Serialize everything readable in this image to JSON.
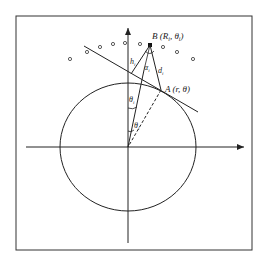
{
  "diagram": {
    "type": "geometry",
    "colors": {
      "stroke": "#222222",
      "background": "#ffffff"
    },
    "labels": {
      "B": "B (R",
      "B_sub": "i",
      "B_mid": ", θ",
      "B_sub2": "i",
      "B_end": ")",
      "A": "A (r, θ)",
      "h": "h",
      "h_sub": "i",
      "alpha": "α",
      "alpha_sub": "i",
      "d": "d",
      "d_sub": "i",
      "theta_i": "θ",
      "theta_i_sub": "i",
      "theta_c": "θ",
      "theta_c_sub": "i"
    },
    "points": {
      "origin": [
        128,
        147
      ],
      "B": [
        150,
        45
      ],
      "A": [
        161,
        90
      ]
    },
    "ellipse": {
      "cx": 128,
      "cy": 147,
      "rx": 68,
      "ry": 64
    },
    "sensor_dots": [
      [
        70,
        59
      ],
      [
        87,
        52
      ],
      [
        100,
        47
      ],
      [
        113,
        44
      ],
      [
        125,
        43
      ],
      [
        140,
        44
      ],
      [
        163,
        47
      ],
      [
        177,
        52
      ],
      [
        193,
        59
      ]
    ]
  }
}
